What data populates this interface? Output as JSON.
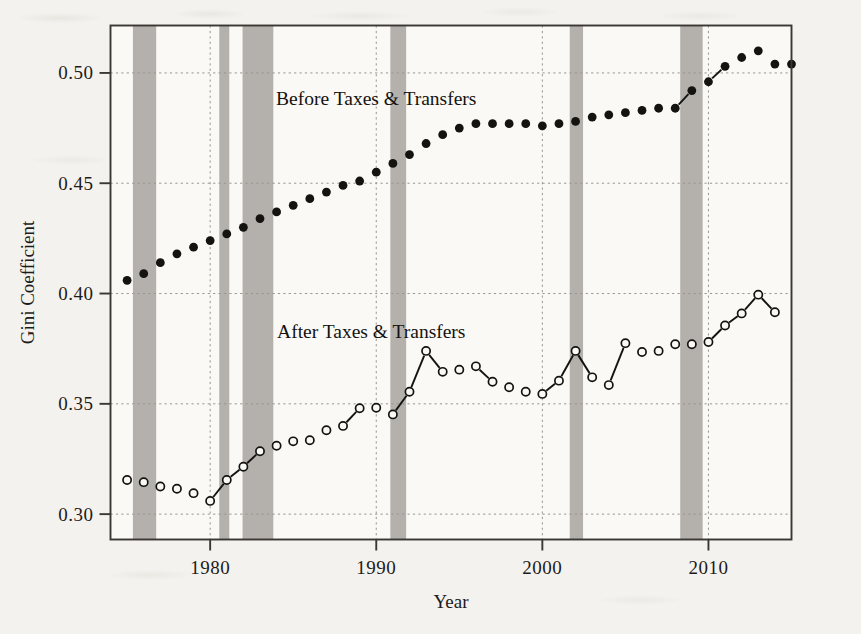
{
  "chart_data": {
    "type": "scatter",
    "title": "",
    "xlabel": "Year",
    "ylabel": "Gini Coefficient",
    "xlim": [
      1974.0,
      2015.0
    ],
    "ylim": [
      0.2885,
      0.5215
    ],
    "xticks": [
      1980,
      1990,
      2000,
      2010
    ],
    "xtick_labels": [
      "1980",
      "1990",
      "2000",
      "2010"
    ],
    "yticks": [
      0.3,
      0.35,
      0.4,
      0.45,
      0.5
    ],
    "ytick_labels": [
      "0.30",
      "0.35",
      "0.40",
      "0.45",
      "0.50"
    ],
    "grid": true,
    "legend_position": "inline-annotation",
    "annotations": [
      {
        "text": "Before Taxes & Transfers",
        "x": 1990.0,
        "y": 0.4855
      },
      {
        "text": "After Taxes & Transfers",
        "x": 1989.7,
        "y": 0.38
      }
    ],
    "shaded_bands_label": "recession",
    "shaded_bands": [
      {
        "start": 1975.35,
        "end": 1976.75
      },
      {
        "start": 1980.55,
        "end": 1981.15
      },
      {
        "start": 1981.95,
        "end": 1983.8
      },
      {
        "start": 1990.85,
        "end": 1991.8
      },
      {
        "start": 2001.65,
        "end": 2002.45
      },
      {
        "start": 2008.3,
        "end": 2009.65
      }
    ],
    "series": [
      {
        "name": "Before Taxes & Transfers",
        "marker": "filled-circle",
        "color": "#151310",
        "x": [
          1975,
          1976,
          1977,
          1978,
          1979,
          1980,
          1981,
          1982,
          1983,
          1984,
          1985,
          1986,
          1987,
          1988,
          1989,
          1990,
          1991,
          1992,
          1993,
          1994,
          1995,
          1996,
          1997,
          1998,
          1999,
          2000,
          2001,
          2002,
          2003,
          2004,
          2005,
          2006,
          2007,
          2008,
          2009,
          2010,
          2011,
          2012,
          2013,
          2014
        ],
        "y": [
          0.406,
          0.409,
          0.414,
          0.418,
          0.421,
          0.424,
          0.427,
          0.43,
          0.434,
          0.437,
          0.44,
          0.443,
          0.446,
          0.449,
          0.451,
          0.455,
          0.459,
          0.463,
          0.468,
          0.472,
          0.475,
          0.477,
          0.477,
          0.477,
          0.477,
          0.476,
          0.477,
          0.478,
          0.48,
          0.481,
          0.482,
          0.483,
          0.484,
          0.484,
          0.492,
          0.496,
          0.503,
          0.507,
          0.51,
          0.506
        ],
        "y_last": 0.504
      },
      {
        "name": "After Taxes & Transfers",
        "marker": "open-circle",
        "color": "#151310",
        "x": [
          1975,
          1976,
          1977,
          1978,
          1979,
          1980,
          1981,
          1982,
          1983,
          1984,
          1985,
          1986,
          1987,
          1988,
          1989,
          1990,
          1991,
          1992,
          1993,
          1994,
          1995,
          1996,
          1997,
          1998,
          1999,
          2000,
          2001,
          2002,
          2003,
          2004,
          2005,
          2006,
          2007,
          2008,
          2009,
          2010,
          2011,
          2012,
          2013,
          2014
        ],
        "y": [
          0.3155,
          0.3145,
          0.3125,
          0.3115,
          0.3095,
          0.306,
          0.3155,
          0.3215,
          0.3285,
          0.331,
          0.333,
          0.3335,
          0.338,
          0.34,
          0.348,
          0.3482,
          0.3452,
          0.3555,
          0.374,
          0.3645,
          0.3655,
          0.367,
          0.36,
          0.3575,
          0.3555,
          0.3545,
          0.3605,
          0.374,
          0.362,
          0.3585,
          0.3775,
          0.3735,
          0.374,
          0.377,
          0.377,
          0.378,
          0.3855,
          0.391,
          0.3995,
          0.3915
        ]
      }
    ]
  },
  "plot": {
    "frame_color": "#3b3732",
    "grid_color": "#9a958d",
    "band_color": "#b0aca6",
    "background": "#faf9f6"
  }
}
